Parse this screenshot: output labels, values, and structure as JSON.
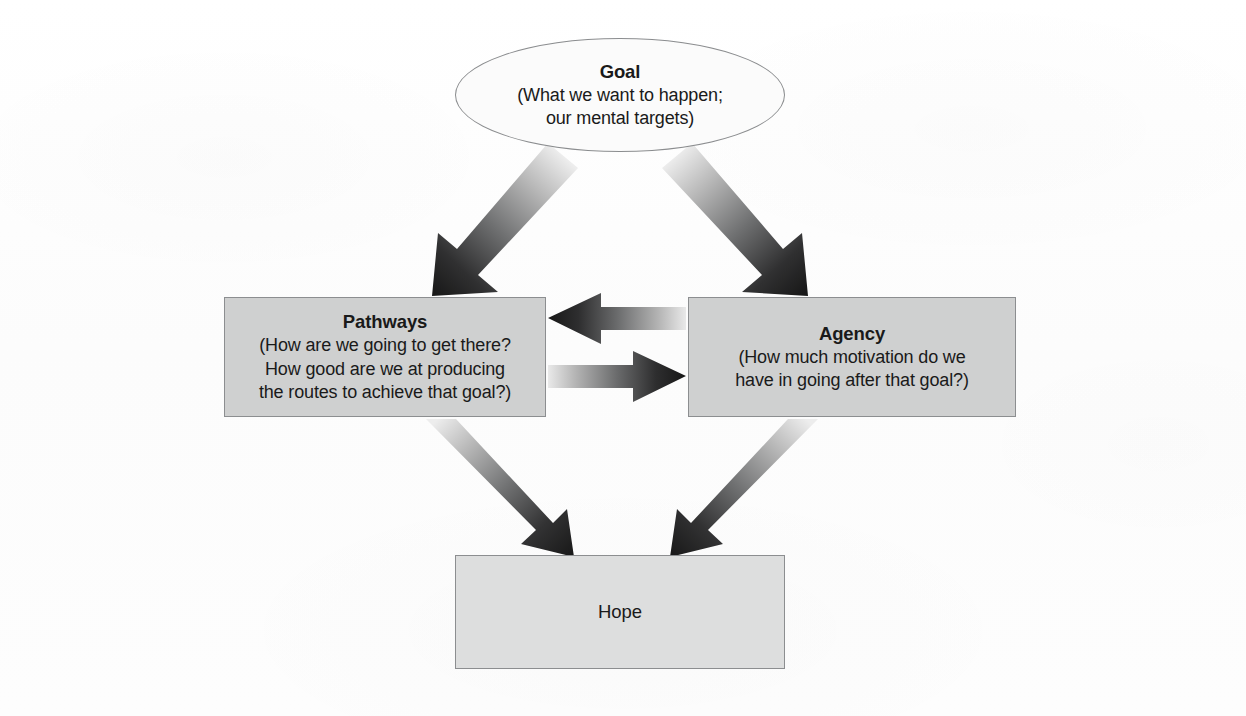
{
  "diagram": {
    "background_color": "#fdfdfd",
    "node_fill_gray": "#cfd0d0",
    "node_fill_light": "#dddede",
    "border_color": "#8c8e90",
    "arrow_dark": "#1c1c1c",
    "arrow_light": "#e6e6e6"
  },
  "nodes": {
    "goal": {
      "id": "goal",
      "shape": "ellipse",
      "title": "Goal",
      "sub_lines": [
        "(What we want to happen;",
        "our mental targets)"
      ]
    },
    "pathways": {
      "id": "pathways",
      "shape": "rectangle",
      "title": "Pathways",
      "sub_lines": [
        "(How are we going to get there?",
        "How good are we at producing",
        "the routes to achieve that goal?)"
      ]
    },
    "agency": {
      "id": "agency",
      "shape": "rectangle",
      "title": "Agency",
      "sub_lines": [
        "(How much motivation do we",
        "have in going after that goal?)"
      ]
    },
    "hope": {
      "id": "hope",
      "shape": "rectangle",
      "label": "Hope"
    }
  },
  "connectors": [
    {
      "id": "goal-to-pathways",
      "from": "goal",
      "to": "pathways",
      "style": "diagonal-gradient-arrow",
      "direction": "down-left"
    },
    {
      "id": "goal-to-agency",
      "from": "goal",
      "to": "agency",
      "style": "diagonal-gradient-arrow",
      "direction": "down-right"
    },
    {
      "id": "agency-to-pathways",
      "from": "agency",
      "to": "pathways",
      "style": "horizontal-gradient-arrow",
      "direction": "left"
    },
    {
      "id": "pathways-to-agency",
      "from": "pathways",
      "to": "agency",
      "style": "horizontal-gradient-arrow",
      "direction": "right"
    },
    {
      "id": "pathways-to-hope",
      "from": "pathways",
      "to": "hope",
      "style": "diagonal-gradient-arrow",
      "direction": "down-right"
    },
    {
      "id": "agency-to-hope",
      "from": "agency",
      "to": "hope",
      "style": "diagonal-gradient-arrow",
      "direction": "down-left"
    }
  ]
}
